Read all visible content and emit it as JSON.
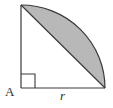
{
  "figure": {
    "kind": "geometry-diagram",
    "canvas": {
      "width": 113,
      "height": 108,
      "background": "#ffffff"
    },
    "colors": {
      "stroke": "#3a3a3a",
      "shade_fill": "#b8b8b8",
      "label_text": "#2e2e2e",
      "background": "#ffffff"
    },
    "points": {
      "A": {
        "x": 21,
        "y": 88,
        "name": "A"
      },
      "top": {
        "x": 21,
        "y": 5,
        "name": "top-vertex"
      },
      "right": {
        "x": 105,
        "y": 88,
        "name": "right-vertex"
      }
    },
    "radius_px": 83,
    "arc": {
      "center": "A",
      "start": "top",
      "end": "right",
      "sweep_degrees": 90,
      "bulge_point": {
        "x": 103,
        "y": 30
      }
    },
    "right_angle_marker": {
      "at": "A",
      "size_px": 14,
      "x": 21,
      "y": 74
    },
    "labels": {
      "vertex_A": "A",
      "side_r": "r"
    },
    "shaded_region": {
      "name": "circular-segment",
      "fill": "#b8b8b8",
      "bounded_by": [
        "chord top-right",
        "arc top-right"
      ]
    }
  }
}
